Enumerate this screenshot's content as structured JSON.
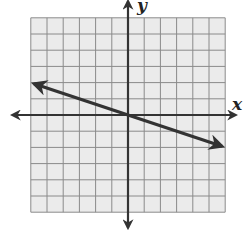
{
  "chart_data": {
    "type": "line",
    "title": "",
    "xlabel": "x",
    "ylabel": "y",
    "xlim": [
      -6,
      6
    ],
    "ylim": [
      -6,
      6
    ],
    "grid": true,
    "grid_step": 1,
    "axes_arrows": true,
    "tick_labels": false,
    "series": [
      {
        "name": "line",
        "slope": -0.3333,
        "intercept": 0,
        "x": [
          -5.8,
          0,
          5.8
        ],
        "y": [
          1.93,
          0,
          -1.93
        ],
        "arrows_both_ends": true
      }
    ]
  },
  "labels": {
    "x_axis": "x",
    "y_axis": "y"
  },
  "colors": {
    "grid_bg": "#ebebeb",
    "grid_line": "#8a8a8a",
    "axis": "#333333",
    "line": "#333333"
  }
}
